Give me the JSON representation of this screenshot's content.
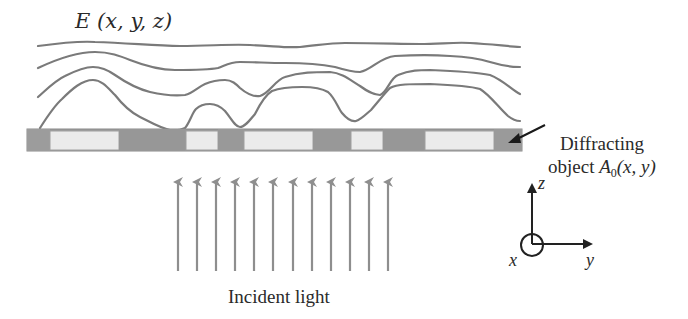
{
  "figure": {
    "field_label": {
      "symbol": "E",
      "args": "(x, y, z)"
    },
    "object_label": {
      "line1": "Diffracting",
      "line2_prefix": "object ",
      "symbol": "A",
      "subscript": "0",
      "args": "(x, y)"
    },
    "incident_label": "Incident light",
    "axes": {
      "z": "z",
      "x": "x",
      "y": "y"
    },
    "colors": {
      "curve": "#7a7a7a",
      "aperture_dark": "#9a9a9a",
      "aperture_light": "#ebebeb",
      "arrow": "#8e8e8e",
      "axes": "#222222",
      "text": "#2a2a2a"
    },
    "aperture_segments": [
      {
        "type": "opaque",
        "x0": 27,
        "x1": 50
      },
      {
        "type": "open",
        "x0": 50,
        "x1": 119
      },
      {
        "type": "opaque",
        "x0": 119,
        "x1": 186
      },
      {
        "type": "open",
        "x0": 186,
        "x1": 218
      },
      {
        "type": "opaque",
        "x0": 218,
        "x1": 244
      },
      {
        "type": "open",
        "x0": 244,
        "x1": 313
      },
      {
        "type": "opaque",
        "x0": 313,
        "x1": 351
      },
      {
        "type": "open",
        "x0": 351,
        "x1": 383
      },
      {
        "type": "opaque",
        "x0": 383,
        "x1": 425
      },
      {
        "type": "open",
        "x0": 425,
        "x1": 494
      },
      {
        "type": "opaque",
        "x0": 494,
        "x1": 522
      }
    ],
    "incident_arrow_count": 12
  }
}
